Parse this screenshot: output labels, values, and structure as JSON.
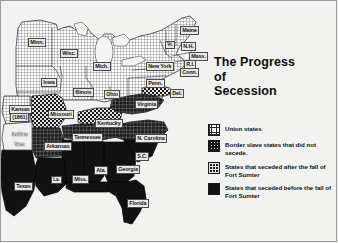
{
  "figure": {
    "title_lines": [
      "The Progress",
      "of",
      "Secession"
    ],
    "title_full": "The Progress of Secession"
  },
  "colors": {
    "background": "#f2f2f0",
    "frame": "#9a9a9a",
    "ink": "#111111",
    "union_fill": "#ffffff",
    "border_state_fill": "#d8d8d8",
    "seceded_after_fill": "#1b1b1b",
    "seceded_before_fill": "#121212",
    "label_box": "#e8e8e6"
  },
  "legend": {
    "items": [
      {
        "swatch": "union-states-swatch",
        "pattern": "fine-grid",
        "label": "Union states"
      },
      {
        "swatch": "border-slave-states-swatch",
        "pattern": "coarse-checker",
        "label": "Border slave states that did not secede."
      },
      {
        "swatch": "seceded-after-sumter-swatch",
        "pattern": "dark-grid",
        "label": "States that seceded after the fall of Fort Sumter"
      },
      {
        "swatch": "seceded-before-sumter-swatch",
        "pattern": "solid-black",
        "label": "States that seceded before the fall of Fort Sumter"
      }
    ]
  },
  "map": {
    "labels": [
      {
        "name": "minnesota",
        "text": "Minn.",
        "x": 28,
        "y": 38,
        "style": "box"
      },
      {
        "name": "wisconsin",
        "text": "Wisc.",
        "x": 60,
        "y": 49,
        "style": "box"
      },
      {
        "name": "michigan",
        "text": "Mich.",
        "x": 93,
        "y": 62,
        "style": "box"
      },
      {
        "name": "iowa",
        "text": "Iowa",
        "x": 41,
        "y": 78,
        "style": "box"
      },
      {
        "name": "illinois",
        "text": "Illinois",
        "x": 73,
        "y": 88,
        "style": "box"
      },
      {
        "name": "ohio",
        "text": "Ohio",
        "x": 104,
        "y": 90,
        "style": "box"
      },
      {
        "name": "kansas",
        "text": "Kansas",
        "x": 9,
        "y": 105,
        "style": "box"
      },
      {
        "name": "kansas-year",
        "text": "(1861)",
        "x": 10,
        "y": 113,
        "style": "box"
      },
      {
        "name": "missouri",
        "text": "Missouri",
        "x": 48,
        "y": 110,
        "style": "box"
      },
      {
        "name": "indian-terr-1",
        "text": "Indian",
        "x": 11,
        "y": 131,
        "style": "plain"
      },
      {
        "name": "indian-terr-2",
        "text": "Terr.",
        "x": 13,
        "y": 141,
        "style": "plain"
      },
      {
        "name": "arkansas",
        "text": "Arkansas",
        "x": 44,
        "y": 142,
        "style": "box"
      },
      {
        "name": "tennessee",
        "text": "Tennessee",
        "x": 72,
        "y": 133,
        "style": "box"
      },
      {
        "name": "kentucky",
        "text": "Kentucky",
        "x": 95,
        "y": 119,
        "style": "box"
      },
      {
        "name": "virginia",
        "text": "Virginia",
        "x": 135,
        "y": 100,
        "style": "box"
      },
      {
        "name": "north-carolina",
        "text": "N. Carolina",
        "x": 135,
        "y": 134,
        "style": "box"
      },
      {
        "name": "south-carolina",
        "text": "S.C.",
        "x": 135,
        "y": 152,
        "style": "box"
      },
      {
        "name": "georgia",
        "text": "Georgia",
        "x": 116,
        "y": 165,
        "style": "box"
      },
      {
        "name": "alabama",
        "text": "Ala.",
        "x": 94,
        "y": 166,
        "style": "box"
      },
      {
        "name": "mississippi",
        "text": "Miss.",
        "x": 72,
        "y": 175,
        "style": "box"
      },
      {
        "name": "louisiana",
        "text": "La.",
        "x": 51,
        "y": 176,
        "style": "box"
      },
      {
        "name": "texas",
        "text": "Texas",
        "x": 14,
        "y": 182,
        "style": "box"
      },
      {
        "name": "florida",
        "text": "Florida",
        "x": 127,
        "y": 199,
        "style": "box"
      },
      {
        "name": "pennsylvania",
        "text": "Penn.",
        "x": 146,
        "y": 79,
        "style": "box"
      },
      {
        "name": "new-york",
        "text": "New York",
        "x": 146,
        "y": 62,
        "style": "box"
      },
      {
        "name": "maine",
        "text": "Maine",
        "x": 180,
        "y": 26,
        "style": "box"
      },
      {
        "name": "vermont",
        "text": "Vt.",
        "x": 165,
        "y": 41,
        "style": "box"
      },
      {
        "name": "new-hampshire",
        "text": "N.H.",
        "x": 181,
        "y": 42,
        "style": "box"
      },
      {
        "name": "massachusetts",
        "text": "Mass.",
        "x": 189,
        "y": 52,
        "style": "box"
      },
      {
        "name": "rhode-island",
        "text": "R.I.",
        "x": 184,
        "y": 60,
        "style": "box"
      },
      {
        "name": "connecticut",
        "text": "Conn.",
        "x": 180,
        "y": 68,
        "style": "box"
      },
      {
        "name": "delaware",
        "text": "Del.",
        "x": 170,
        "y": 89,
        "style": "box"
      }
    ]
  }
}
